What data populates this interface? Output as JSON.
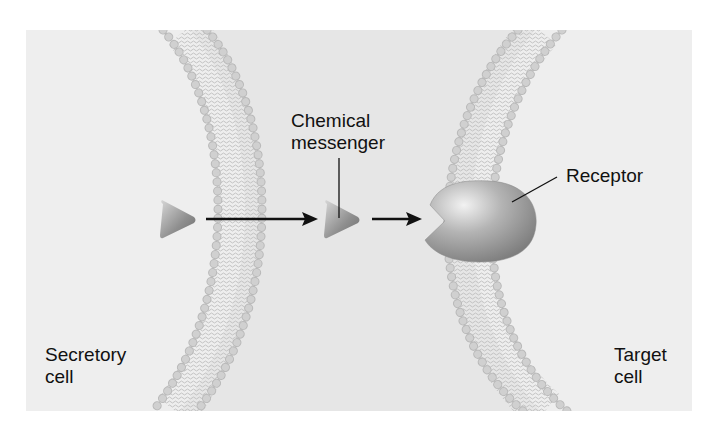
{
  "figure": {
    "background_color": "#efefef",
    "membrane_head_color": "#c9c9c9",
    "membrane_tail_color": "#b5b5b5",
    "messenger_color": "#8d8d8d",
    "receptor_color": "#8a8a8a"
  },
  "labels": {
    "chemical_messenger_line1": "Chemical",
    "chemical_messenger_line2": "messenger",
    "receptor": "Receptor",
    "secretory_cell_line1": "Secretory",
    "secretory_cell_line2": "cell",
    "target_cell_line1": "Target",
    "target_cell_line2": "cell"
  },
  "elements": {
    "messengers": [
      {
        "id": "messenger-in-secretory-cell",
        "x": 176,
        "y": 220
      },
      {
        "id": "messenger-in-extracellular-space",
        "x": 341,
        "y": 220
      }
    ],
    "arrows": [
      {
        "id": "arrow-1",
        "from_x": 206,
        "to_x": 318,
        "y": 219
      },
      {
        "id": "arrow-2",
        "from_x": 372,
        "to_x": 420,
        "y": 219
      }
    ],
    "membranes": [
      "secretory-cell-membrane",
      "target-cell-membrane"
    ],
    "receptor": {
      "cx": 478,
      "cy": 222
    }
  }
}
